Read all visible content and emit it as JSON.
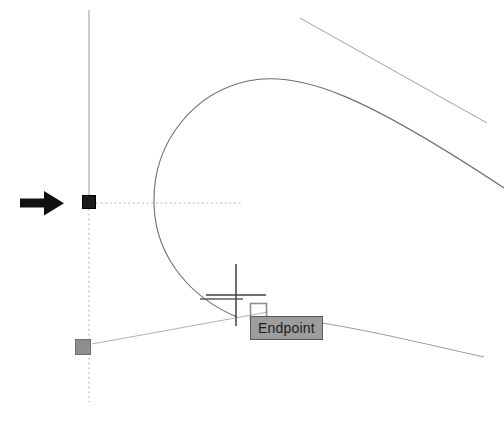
{
  "app": {
    "context": "cad-drawing-viewport",
    "background_color": "#ffffff"
  },
  "viewport": {
    "width": 504,
    "height": 428
  },
  "tooltip": {
    "label": "Endpoint",
    "background_color": "#9d9d9d",
    "border_color": "#5a5a5a",
    "text_color": "#1c1c1c",
    "x": 250,
    "y": 316,
    "width": 72,
    "height": 24
  },
  "markers": {
    "selected_grip": {
      "name": "grip-selected",
      "color": "#1a1a1a",
      "x": 89,
      "y": 202,
      "size": 13
    },
    "unselected_grip": {
      "name": "grip-unselected",
      "color": "#8c8c8c",
      "border_color": "#6f6f6f",
      "x": 83,
      "y": 347,
      "size": 15
    },
    "osnap_square": {
      "name": "endpoint-osnap-marker",
      "color": "#8f8f8f",
      "x": 258,
      "y": 311,
      "size": 16
    }
  },
  "cursor": {
    "name": "crosshair-cursor",
    "x": 236,
    "y": 292,
    "arm_length": 30,
    "color": "#3a3a3a"
  },
  "annotation_arrow": {
    "label": "",
    "color": "#111111",
    "from_x": 20,
    "to_x": 62,
    "y": 203
  },
  "geometry": {
    "vertical_axis": {
      "name": "vertical-construction-line",
      "x": 89,
      "solid_from_y": 10,
      "solid_to_y": 196,
      "dotted_from_y": 209,
      "dotted_to_y": 402,
      "color": "#9a9a9a"
    },
    "tracking_horizontal": {
      "name": "polar-tracking-line",
      "y": 203,
      "from_x": 96,
      "to_x": 242,
      "color": "#b4b4b4"
    },
    "arc": {
      "name": "main-arc",
      "color": "#6e6e6e",
      "path": "M 237 317 C 196 300 156 262 154 205 C 152 140 196 92 248 81 C 300 70 365 96 504 188"
    },
    "upper_diagonal": {
      "name": "upper-diagonal-line",
      "color": "#9e9e9e",
      "x1": 300,
      "y1": 18,
      "x2": 487,
      "y2": 123
    },
    "lower_right_line": {
      "name": "lower-right-line",
      "color": "#9e9e9e",
      "path": "M 322 323 C 380 333 440 347 484 357"
    },
    "grip_to_cursor_line": {
      "name": "grip-to-cursor-line",
      "color": "#b0b0b0",
      "x1": 92,
      "y1": 344,
      "x2": 266,
      "y2": 312
    },
    "cursor_tick": {
      "name": "snap-tick-line",
      "color": "#5a5a5a",
      "x1": 200,
      "y1": 299,
      "x2": 243,
      "y2": 299
    }
  }
}
